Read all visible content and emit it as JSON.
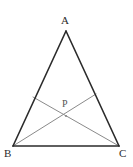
{
  "figure": {
    "type": "geometry-diagram",
    "background_color": "#ffffff",
    "width": 133,
    "height": 167,
    "triangle": {
      "name": "triangle-ABC",
      "stroke_color": "#2b2b2b",
      "stroke_width": 1.6,
      "vertices": [
        {
          "id": "A",
          "label": "A",
          "x": 66,
          "y": 31
        },
        {
          "id": "B",
          "label": "B",
          "x": 13,
          "y": 146
        },
        {
          "id": "C",
          "label": "C",
          "x": 119,
          "y": 146
        }
      ],
      "sides": [
        {
          "id": "AB",
          "from": "A",
          "to": "B"
        },
        {
          "id": "AC",
          "from": "A",
          "to": "C"
        },
        {
          "id": "BC",
          "from": "B",
          "to": "C"
        }
      ]
    },
    "cevians": {
      "stroke_color": "#8a8a8a",
      "stroke_width": 1.0,
      "segments": [
        {
          "id": "cevian-B-to-AC",
          "from": "B",
          "to_point": "E",
          "x1": 13,
          "y1": 146,
          "x2": 96,
          "y2": 94
        },
        {
          "id": "cevian-C-to-AB",
          "from": "C",
          "to_point": "F",
          "x1": 119,
          "y1": 146,
          "x2": 33,
          "y2": 97
        }
      ]
    },
    "intersection": {
      "id": "P",
      "label": "P",
      "x": 66,
      "y": 116,
      "marker_color": "#8a8a8a",
      "marker_radius": 1.1
    },
    "labels": {
      "A": "A",
      "B": "B",
      "C": "C",
      "P": "P"
    }
  }
}
